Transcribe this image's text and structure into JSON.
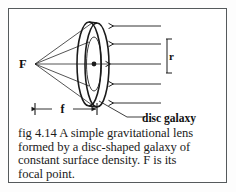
{
  "figure": {
    "id": "fig 4.14",
    "caption": "fig 4.14 A simple gravitational lens formed by a disc-shaped galaxy of constant surface density. F is its focal point.",
    "caption_lines": [
      "fig 4.14 A simple gravitational lens",
      "formed by a disc-shaped galaxy of",
      "constant surface density. F is its",
      "focal point."
    ]
  },
  "diagram": {
    "focal_point_label": "F",
    "focal_length_label": "f",
    "radius_label": "r",
    "disc_label": "disc galaxy",
    "ray_count": 5,
    "ray_direction": "right-to-left",
    "line_color": "#1b1b1b",
    "frame_color": "#555a5c",
    "background_color": "#ffffff"
  }
}
